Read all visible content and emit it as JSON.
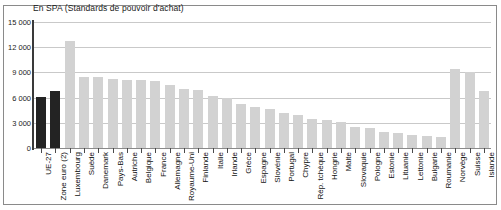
{
  "figure": {
    "unit_caption": "En SPA (Standards de pouvoir d'achat)",
    "grid_color": "#c9c9c9",
    "axis_color": "#3a3a3a",
    "border_color": "#8a8a8a",
    "highlight_bar_color": "#232323",
    "default_bar_color": "#d2d2d2"
  },
  "chart_data": {
    "type": "bar",
    "title": "En SPA (Standards de pouvoir d'achat)",
    "xlabel": "",
    "ylabel": "",
    "ylim": [
      0,
      15000
    ],
    "grid": true,
    "legend": "none",
    "ytick_labels": [
      "15 000",
      "12 000",
      "9 000",
      "6 000",
      "3 000",
      "0"
    ],
    "ytick_values": [
      15000,
      12000,
      9000,
      6000,
      3000,
      0
    ],
    "categories": [
      "UE-27",
      "Zone euro (2)",
      "Luxembourg",
      "Suède",
      "Danemark",
      "Pays-Bas",
      "Autriche",
      "Belgique",
      "France",
      "Allemagne",
      "Royaume-Uni",
      "Finlande",
      "Italie",
      "Irlande",
      "Grèce",
      "Espagne",
      "Slovénie",
      "Portugal",
      "Chypre",
      "Rép. tchèque",
      "Hongrie",
      "Malte",
      "Slovaquie",
      "Pologne",
      "Estonie",
      "Lituanie",
      "Lettonie",
      "Bulgarie",
      "Roumanie",
      "Norvège",
      "Suisse",
      "Islande"
    ],
    "values": [
      6100,
      6800,
      12700,
      8400,
      8400,
      8200,
      8050,
      8050,
      7950,
      7450,
      7050,
      6850,
      6200,
      5900,
      5250,
      4900,
      4600,
      4200,
      3950,
      3450,
      3350,
      3100,
      2500,
      2350,
      1950,
      1750,
      1600,
      1450,
      1300,
      9450,
      9050,
      6800
    ],
    "highlighted": [
      "UE-27",
      "Zone euro (2)"
    ]
  }
}
